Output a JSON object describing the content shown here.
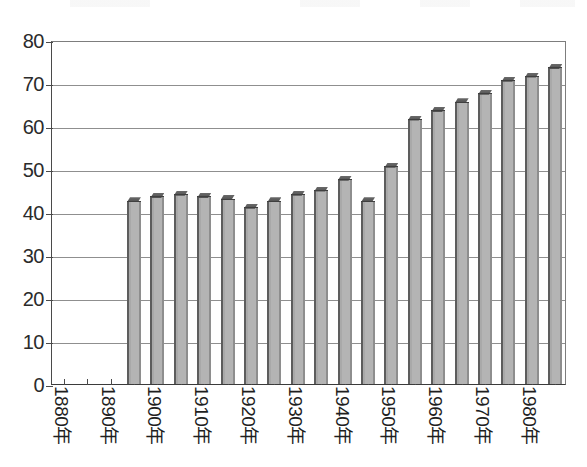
{
  "chart_data": {
    "type": "bar",
    "title": "",
    "subtitle": "",
    "xlabel": "",
    "ylabel": "",
    "ylim": [
      0,
      80
    ],
    "ytick_values": [
      0,
      10,
      20,
      30,
      40,
      50,
      60,
      70,
      80
    ],
    "ytick_labels": [
      "0",
      "10",
      "20",
      "30",
      "40",
      "50",
      "60",
      "70",
      "80"
    ],
    "grid": true,
    "legend": "none",
    "xtick_major_labels": [
      "1880年",
      "1890年",
      "1900年",
      "1910年",
      "1920年",
      "1930年",
      "1940年",
      "1950年",
      "1960年",
      "1970年",
      "1980年"
    ],
    "xtick_major_years": [
      1880,
      1890,
      1900,
      1910,
      1920,
      1930,
      1940,
      1950,
      1960,
      1970,
      1980
    ],
    "xtick_minor_years": [
      1885,
      1895,
      1905,
      1915,
      1925,
      1935,
      1945,
      1955,
      1965,
      1975,
      1985
    ],
    "x_start_year": 1880,
    "x_end_year": 1985,
    "x_step_years": 5,
    "categories": [
      1895,
      1900,
      1905,
      1910,
      1915,
      1920,
      1925,
      1930,
      1935,
      1940,
      1945,
      1950,
      1955,
      1960,
      1965,
      1970,
      1975,
      1980,
      1985
    ],
    "values": [
      42.5,
      43.5,
      44.0,
      43.5,
      43.0,
      41.0,
      42.5,
      44.0,
      45.0,
      47.5,
      42.5,
      50.5,
      61.5,
      63.5,
      65.5,
      67.5,
      70.5,
      71.5,
      73.5
    ],
    "empty_categories": [
      1880,
      1885,
      1890
    ],
    "bar_fill_color": "#b4b4b4",
    "bar_edge_color": "#5a5a5a",
    "grid_color": "#8f8f8f",
    "axis_color": "#3b3b3b",
    "text_color": "#1f1f1f"
  }
}
